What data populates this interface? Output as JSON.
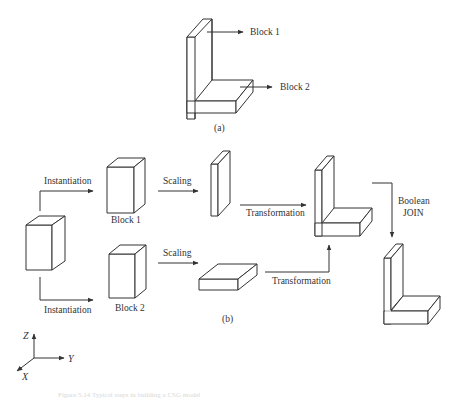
{
  "figure": {
    "part_a": {
      "label": "(a)",
      "callouts": [
        {
          "text": "Block 1"
        },
        {
          "text": "Block 2"
        }
      ]
    },
    "part_b": {
      "label": "(b)",
      "steps": {
        "instantiation_top": "Instantiation",
        "instantiation_bottom": "Instantiation",
        "block1": "Block 1",
        "block2": "Block 2",
        "scaling_top": "Scaling",
        "scaling_bottom": "Scaling",
        "transformation_top": "Transformation",
        "transformation_bottom": "Transformation",
        "boolean_line1": "Boolean",
        "boolean_line2": "JOIN"
      }
    },
    "axes": {
      "z": "Z",
      "y": "Y",
      "x": "X"
    },
    "caption": "Figure 5.14  Typical steps in building a CSG model"
  },
  "colors": {
    "stroke": "#333333",
    "background": "#ffffff"
  }
}
